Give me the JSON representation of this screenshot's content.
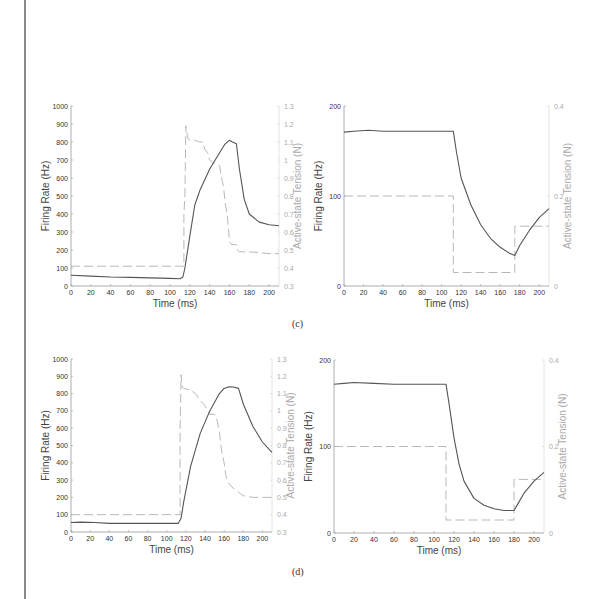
{
  "captions": {
    "c": "(c)",
    "d": "(d)"
  },
  "chart_data": [
    {
      "id": "c-left",
      "type": "line",
      "panel": "(c)",
      "title": "",
      "xlabel": "Time (ms)",
      "ylabel": "Firing Rate (Hz)",
      "ylabel_right": "Active-state Tension (N)",
      "xlim": [
        0,
        210
      ],
      "ylim": [
        0,
        1000
      ],
      "ylim_right": [
        0.3,
        1.3
      ],
      "xticks": [
        0,
        20,
        40,
        60,
        80,
        100,
        120,
        140,
        160,
        180,
        200
      ],
      "yticks": [
        0,
        100,
        200,
        300,
        400,
        500,
        600,
        700,
        800,
        900,
        1000
      ],
      "yticks_right": [
        0.3,
        0.4,
        0.5,
        0.6,
        0.7,
        0.8,
        0.9,
        1,
        1.1,
        1.2,
        1.3
      ],
      "grid": false,
      "series": [
        {
          "name": "Active-state Tension",
          "axis": "right",
          "style": "dashed",
          "color": "#b0b0b0",
          "x": [
            0,
            114,
            114,
            115,
            116,
            117,
            118,
            120,
            125,
            130,
            133,
            135,
            138,
            140,
            145,
            150,
            152,
            154,
            156,
            158,
            160,
            162,
            165,
            167,
            168,
            170,
            180,
            200,
            210
          ],
          "y": [
            0.41,
            0.41,
            0.7,
            0.8,
            1.19,
            1.15,
            1.12,
            1.11,
            1.11,
            1.1,
            1.1,
            1.06,
            1.04,
            1.0,
            0.98,
            0.97,
            0.9,
            0.85,
            0.75,
            0.68,
            0.55,
            0.53,
            0.53,
            0.53,
            0.5,
            0.49,
            0.49,
            0.48,
            0.48
          ]
        },
        {
          "name": "Firing Rate",
          "axis": "left",
          "style": "solid",
          "color": "#555555",
          "x": [
            0,
            20,
            40,
            60,
            80,
            100,
            110,
            113,
            115,
            120,
            125,
            130,
            140,
            150,
            155,
            160,
            163,
            167,
            170,
            175,
            180,
            190,
            200,
            210
          ],
          "y": [
            60,
            55,
            50,
            48,
            45,
            42,
            40,
            50,
            100,
            280,
            450,
            530,
            650,
            740,
            785,
            810,
            800,
            790,
            650,
            480,
            400,
            355,
            340,
            335
          ]
        }
      ]
    },
    {
      "id": "c-right",
      "type": "line",
      "panel": "(c)",
      "title": "",
      "xlabel": "Time (ms)",
      "ylabel": "Firing Rate (Hz)",
      "ylabel_right": "Active-state Tension (N)",
      "xlim": [
        0,
        210
      ],
      "ylim": [
        0,
        200
      ],
      "ylim_right": [
        0,
        0.4
      ],
      "xticks": [
        0,
        20,
        40,
        60,
        80,
        100,
        120,
        140,
        160,
        180,
        200
      ],
      "yticks": [
        0,
        100,
        200
      ],
      "yticks_right": [
        0,
        0.2,
        0.4
      ],
      "grid": false,
      "series": [
        {
          "name": "Active-state Tension",
          "axis": "right",
          "style": "dashed",
          "color": "#b0b0b0",
          "x": [
            0,
            112,
            112,
            175,
            175,
            210
          ],
          "y": [
            0.2,
            0.2,
            0.03,
            0.03,
            0.133,
            0.133
          ]
        },
        {
          "name": "Firing Rate",
          "axis": "left",
          "style": "solid",
          "color": "#555555",
          "x": [
            0,
            10,
            25,
            40,
            60,
            80,
            100,
            112,
            115,
            120,
            130,
            140,
            150,
            160,
            170,
            175,
            180,
            190,
            200,
            210
          ],
          "y": [
            171,
            172,
            173,
            172,
            172,
            172,
            172,
            172,
            150,
            120,
            90,
            68,
            53,
            43,
            36,
            34,
            45,
            62,
            76,
            86
          ]
        }
      ]
    },
    {
      "id": "d-left",
      "type": "line",
      "panel": "(d)",
      "title": "",
      "xlabel": "Time (ms)",
      "ylabel": "Firing Rate (Hz)",
      "ylabel_right": "Active-state Tension (N)",
      "xlim": [
        0,
        210
      ],
      "ylim": [
        0,
        1000
      ],
      "ylim_right": [
        0.3,
        1.3
      ],
      "xticks": [
        0,
        20,
        40,
        60,
        80,
        100,
        120,
        140,
        160,
        180,
        200
      ],
      "yticks": [
        0,
        100,
        200,
        300,
        400,
        500,
        600,
        700,
        800,
        900,
        1000
      ],
      "yticks_right": [
        0.3,
        0.4,
        0.5,
        0.6,
        0.7,
        0.8,
        0.9,
        1,
        1.1,
        1.2,
        1.3
      ],
      "grid": false,
      "series": [
        {
          "name": "Active-state Tension",
          "axis": "right",
          "style": "dashed",
          "color": "#b0b0b0",
          "x": [
            0,
            114,
            114,
            115,
            116,
            118,
            125,
            130,
            135,
            140,
            145,
            150,
            152,
            155,
            157,
            160,
            162,
            165,
            170,
            175,
            180,
            190,
            200,
            210
          ],
          "y": [
            0.4,
            0.4,
            0.9,
            1.21,
            1.14,
            1.13,
            1.12,
            1.1,
            1.06,
            1.03,
            0.98,
            0.98,
            0.96,
            0.88,
            0.78,
            0.7,
            0.62,
            0.58,
            0.55,
            0.53,
            0.51,
            0.5,
            0.5,
            0.5
          ]
        },
        {
          "name": "Firing Rate",
          "axis": "left",
          "style": "solid",
          "color": "#555555",
          "x": [
            0,
            10,
            25,
            40,
            60,
            80,
            100,
            112,
            115,
            118,
            125,
            135,
            145,
            155,
            160,
            165,
            170,
            175,
            180,
            190,
            200,
            210
          ],
          "y": [
            55,
            57,
            55,
            50,
            50,
            50,
            50,
            50,
            80,
            180,
            380,
            570,
            700,
            800,
            830,
            840,
            838,
            830,
            740,
            610,
            520,
            460
          ]
        }
      ]
    },
    {
      "id": "d-right",
      "type": "line",
      "panel": "(d)",
      "title": "",
      "xlabel": "Time (ms)",
      "ylabel": "Firing Rate (Hz)",
      "ylabel_right": "Active-state Tension (N)",
      "xlim": [
        0,
        210
      ],
      "ylim": [
        0,
        200
      ],
      "ylim_right": [
        0,
        0.4
      ],
      "xticks": [
        0,
        20,
        40,
        60,
        80,
        100,
        120,
        140,
        160,
        180,
        200
      ],
      "yticks": [
        0,
        100,
        200
      ],
      "yticks_right": [
        0,
        0.2,
        0.4
      ],
      "grid": false,
      "series": [
        {
          "name": "Active-state Tension",
          "axis": "right",
          "style": "dashed",
          "color": "#b0b0b0",
          "x": [
            0,
            112,
            112,
            180,
            180,
            210
          ],
          "y": [
            0.2,
            0.2,
            0.03,
            0.03,
            0.124,
            0.124
          ]
        },
        {
          "name": "Firing Rate",
          "axis": "left",
          "style": "solid",
          "color": "#555555",
          "x": [
            0,
            10,
            20,
            40,
            60,
            80,
            100,
            112,
            115,
            120,
            125,
            130,
            140,
            150,
            160,
            170,
            180,
            185,
            190,
            200,
            210
          ],
          "y": [
            172,
            173,
            174,
            173,
            172,
            172,
            172,
            172,
            150,
            110,
            80,
            60,
            40,
            32,
            28,
            26,
            26,
            36,
            46,
            60,
            70
          ]
        }
      ]
    }
  ]
}
